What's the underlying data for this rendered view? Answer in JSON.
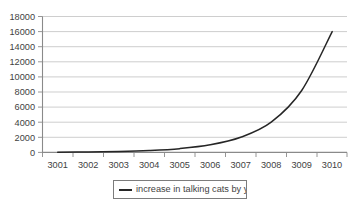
{
  "chart_data": {
    "type": "line",
    "title": "",
    "subtitle": "",
    "xlabel": "",
    "ylabel": "",
    "categories": [
      "3001",
      "3002",
      "3003",
      "3004",
      "3005",
      "3006",
      "3007",
      "3008",
      "3009",
      "3010"
    ],
    "series": [
      {
        "name": "increase in talking cats by year",
        "color": "#262626",
        "values": [
          30,
          60,
          120,
          250,
          500,
          1000,
          2000,
          4000,
          8200,
          16000
        ]
      }
    ],
    "ylim": [
      0,
      18000
    ],
    "ytick_labels": [
      "18000",
      "16000",
      "14000",
      "12000",
      "10000",
      "8000",
      "6000",
      "4000",
      "2000",
      "0"
    ],
    "ytick_values": [
      18000,
      16000,
      14000,
      12000,
      10000,
      8000,
      6000,
      4000,
      2000,
      0
    ],
    "ytick_step": 2000,
    "grid": true,
    "grid_axis": "y",
    "legend": {
      "position": "bottom",
      "entries": [
        {
          "label": "increase in talking cats by year",
          "color": "#262626",
          "marker": "line"
        }
      ]
    }
  }
}
